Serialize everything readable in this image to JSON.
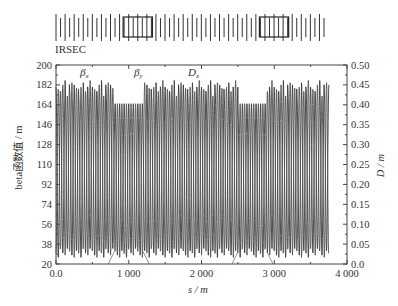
{
  "lattice": {
    "label": "IRSEC",
    "element_count": 60,
    "boxes": [
      {
        "start_index": 15,
        "end_index": 21
      },
      {
        "start_index": 45,
        "end_index": 51
      }
    ]
  },
  "chart_data": {
    "type": "line",
    "title": "",
    "xlabel": "s / m",
    "ylabel_left": "beta函数值 / m",
    "ylabel_right": "D / m",
    "xlim": [
      0,
      4000
    ],
    "ylim_left": [
      20,
      200
    ],
    "ylim_right": [
      0.0,
      0.5
    ],
    "x_ticks": [
      "0.0",
      "1 000",
      "2 000",
      "3 000",
      "4 000"
    ],
    "y_ticks_left": [
      "20",
      "38",
      "56",
      "74",
      "92",
      "110",
      "128",
      "146",
      "164",
      "182",
      "200"
    ],
    "y_ticks_right": [
      "0.0",
      "0.05",
      "0.10",
      "0.15",
      "0.20",
      "0.25",
      "0.30",
      "0.35",
      "0.40",
      "0.45",
      "0.50"
    ],
    "grid": false,
    "series": [
      {
        "name": "βx",
        "axis": "left",
        "approx_max": 185,
        "approx_min": 25,
        "note": "periodic oscillation over s = 0–3750 m, ~60 cells"
      },
      {
        "name": "βy",
        "axis": "left",
        "approx_max": 180,
        "approx_min": 25,
        "note": "periodic oscillation, reduced peaks (~165) in IR sections near s≈1000 m and s≈2700 m"
      },
      {
        "name": "Dx",
        "axis": "right",
        "approx_max": 0.0,
        "approx_min": 0.0,
        "note": "dispersion near zero, small bumps at IR section edges"
      }
    ],
    "annotations": [
      {
        "text": "βx",
        "x": 300,
        "y": 195
      },
      {
        "text": "βy",
        "x": 1050,
        "y": 195
      },
      {
        "text": "Dx",
        "x": 1700,
        "y": 195
      }
    ],
    "data_range_s": [
      0,
      3750
    ]
  }
}
